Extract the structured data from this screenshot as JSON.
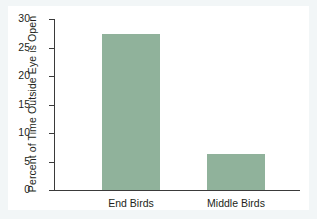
{
  "chart_data": {
    "type": "bar",
    "title": "",
    "xlabel": "",
    "ylabel": "Percent of Time Outside Eye is Open",
    "categories": [
      "End Birds",
      "Middle Birds"
    ],
    "values": [
      27.4,
      6.4
    ],
    "ylim": [
      0,
      30
    ],
    "yticks": [
      0,
      5,
      10,
      15,
      20,
      25,
      30
    ],
    "ytick_labels": [
      "0",
      "5",
      "10",
      "15",
      "20",
      "25",
      "30"
    ],
    "grid": false,
    "legend": "none",
    "bar_color": "#90b29b",
    "axis_color": "#3a3a3a",
    "background_color": "#ffffff",
    "figure_background_color": "#f2f6f7"
  }
}
